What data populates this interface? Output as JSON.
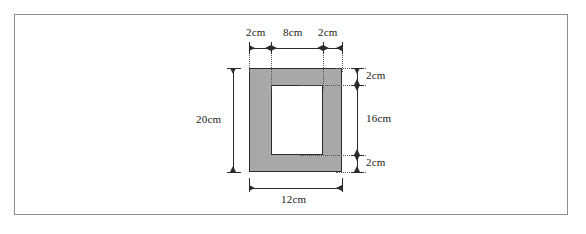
{
  "figure": {
    "shape": {
      "outer": {
        "width_label": "12cm",
        "height_label": "20cm"
      },
      "inner": {
        "width_label": "8cm",
        "height_label": "16cm"
      },
      "border": {
        "left_label": "2cm",
        "right_label": "2cm",
        "top_label": "2cm",
        "bottom_label": "2cm"
      },
      "fill_color": "#a8a8a8",
      "inner_fill_color": "#ffffff",
      "line_color": "#2b2b2b"
    },
    "dimensions": {
      "top_left": "2cm",
      "top_middle": "8cm",
      "top_right": "2cm",
      "left_total": "20cm",
      "right_top": "2cm",
      "right_middle": "16cm",
      "right_bottom": "2cm",
      "bottom_total": "12cm"
    }
  }
}
